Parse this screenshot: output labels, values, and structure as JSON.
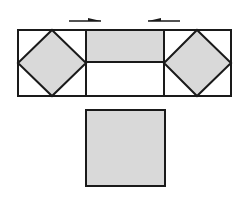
{
  "diagram": {
    "colors": {
      "stroke": "#1a1a1a",
      "fill": "#d9d9d9",
      "background": "#ffffff"
    },
    "arrows": [
      {
        "direction": "right",
        "x1": 69,
        "x2": 101,
        "y": 21
      },
      {
        "direction": "left",
        "x1": 148,
        "x2": 180,
        "y": 21
      }
    ],
    "outer_rect": {
      "x": 18,
      "y": 30,
      "w": 213,
      "h": 66
    },
    "bottom_square": {
      "x": 86,
      "y": 110,
      "w": 79,
      "h": 76
    }
  }
}
